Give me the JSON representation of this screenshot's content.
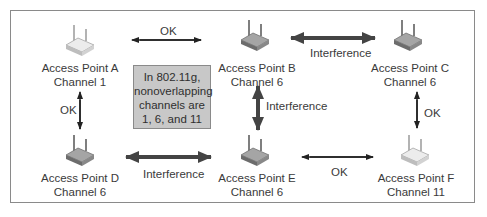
{
  "diagram": {
    "type": "network-topology",
    "note": {
      "lines": [
        "In 802.11g,",
        "nonoverlapping",
        "channels are",
        "1, 6, and 11"
      ]
    },
    "nodes": [
      {
        "id": "A",
        "name": "Access Point A",
        "channel": "Channel 1",
        "icon": "wireless-router-icon",
        "style": "light"
      },
      {
        "id": "B",
        "name": "Access Point B",
        "channel": "Channel 6",
        "icon": "wireless-router-icon",
        "style": "dark"
      },
      {
        "id": "C",
        "name": "Access Point C",
        "channel": "Channel 6",
        "icon": "wireless-router-icon",
        "style": "dark"
      },
      {
        "id": "D",
        "name": "Access Point D",
        "channel": "Channel 6",
        "icon": "wireless-router-icon",
        "style": "dark"
      },
      {
        "id": "E",
        "name": "Access Point E",
        "channel": "Channel 6",
        "icon": "wireless-router-icon",
        "style": "dark"
      },
      {
        "id": "F",
        "name": "Access Point F",
        "channel": "Channel 11",
        "icon": "wireless-router-icon",
        "style": "light"
      }
    ],
    "edges": [
      {
        "from": "A",
        "to": "B",
        "label": "OK",
        "weight": "thin"
      },
      {
        "from": "B",
        "to": "C",
        "label": "Interference",
        "weight": "thick"
      },
      {
        "from": "A",
        "to": "D",
        "label": "OK",
        "weight": "thin"
      },
      {
        "from": "B",
        "to": "E",
        "label": "Interference",
        "weight": "thick"
      },
      {
        "from": "C",
        "to": "F",
        "label": "OK",
        "weight": "thin"
      },
      {
        "from": "D",
        "to": "E",
        "label": "Interference",
        "weight": "thick"
      },
      {
        "from": "E",
        "to": "F",
        "label": "OK",
        "weight": "thin"
      }
    ],
    "colors": {
      "frame": "#8a8a8a",
      "note_bg": "#c8c8c8",
      "arrow_thin": "#222222",
      "arrow_thick": "#444444",
      "router_dark": "#9a9a9a",
      "router_light": "#e6e6e6"
    }
  }
}
